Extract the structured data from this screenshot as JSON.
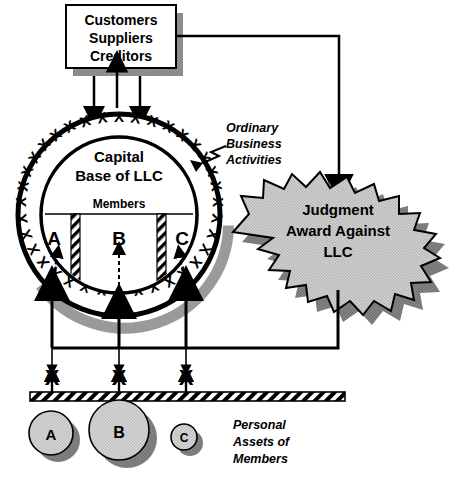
{
  "diagram": {
    "title_note": "LLC liability shield diagram",
    "stakeholder_box": {
      "lines": [
        "Customers",
        "Suppliers",
        "Creditors"
      ],
      "shadow_color": "#8c8c8c",
      "fill": "#ffffff",
      "stroke": "#000000"
    },
    "llc_circle": {
      "heading_line1": "Capital",
      "heading_line2": "Base of LLC",
      "members_label": "Members",
      "ring_mark": "X",
      "ring_mark_count": 34,
      "members": [
        {
          "id": "member-a",
          "label": "A"
        },
        {
          "id": "member-b",
          "label": "B"
        },
        {
          "id": "member-c",
          "label": "C"
        }
      ],
      "shadow_color": "#9a9a9a",
      "fill": "#ffffff",
      "stroke": "#000000"
    },
    "annotation_ordinary": {
      "lines": [
        "Ordinary",
        "Business",
        "Activities"
      ]
    },
    "judgment_burst": {
      "lines": [
        "Judgment",
        "Award Against",
        "LLC"
      ],
      "fill": "#c8c8c8",
      "shadow_color": "#828282",
      "stroke": "#000000"
    },
    "barrier": {
      "x_marks": [
        "X",
        "X",
        "X"
      ],
      "bar_fill": "#ffffff",
      "bar_hatch": "#000000"
    },
    "personal_assets": {
      "caption_lines": [
        "Personal",
        "Assets of",
        "Members"
      ],
      "circles": [
        {
          "id": "asset-a",
          "label": "A",
          "radius": 22
        },
        {
          "id": "asset-b",
          "label": "B",
          "radius": 30
        },
        {
          "id": "asset-c",
          "label": "C",
          "radius": 13
        }
      ],
      "fill": "#d2d2d2",
      "shadow_color": "#595959",
      "stroke": "#000000"
    }
  }
}
